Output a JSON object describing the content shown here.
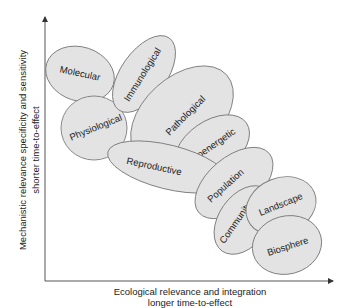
{
  "diagram": {
    "y_axis": {
      "line1": "Mechanistic relevance specificity and sensitivity",
      "line2": "shorter time-to-effect"
    },
    "x_axis": {
      "line1": "Ecological relevance and integration",
      "line2": "longer time-to-effect"
    },
    "nodes": [
      {
        "id": "molecular",
        "label": "Molecular"
      },
      {
        "id": "immunological",
        "label": "Immunological"
      },
      {
        "id": "physiological",
        "label": "Physiological"
      },
      {
        "id": "pathological",
        "label": "Pathological"
      },
      {
        "id": "bioenergetic",
        "label": "Bioenergetic"
      },
      {
        "id": "reproductive",
        "label": "Reproductive"
      },
      {
        "id": "population",
        "label": "Population"
      },
      {
        "id": "community",
        "label": "Community"
      },
      {
        "id": "landscape",
        "label": "Landscape"
      },
      {
        "id": "biosphere",
        "label": "Biosphere"
      }
    ],
    "colors": {
      "ellipse_fill": "#e3e3e3",
      "ellipse_stroke": "#7d7d7d",
      "axis": "#555555",
      "text": "#222222"
    }
  }
}
